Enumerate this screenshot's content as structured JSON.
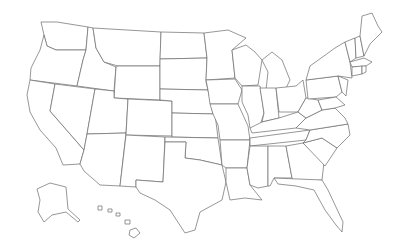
{
  "map": {
    "title": "",
    "type": "outline",
    "region": "United States",
    "background": "#ffffff",
    "stroke_color": "#6a6a6a",
    "states": [
      {
        "id": "WA",
        "points": "41,22 57,22 88,27 86,50 56,50 47,46 44,35"
      },
      {
        "id": "OR",
        "points": "44,35 47,46 56,50 86,50 83,60 77,86 30,80 31,68 40,50"
      },
      {
        "id": "CA",
        "points": "30,80 55,84 50,111 84,150 80,164 63,165 56,148 40,130 30,112 27,95"
      },
      {
        "id": "ID",
        "points": "88,27 93,28 96,48 104,62 116,67 114,91 77,86 83,60 86,50"
      },
      {
        "id": "NV",
        "points": "55,84 95,89 87,134 84,150 50,111"
      },
      {
        "id": "MT",
        "points": "93,28 161,32 160,66 118,66 104,62 96,48"
      },
      {
        "id": "WY",
        "points": "118,66 160,66 160,100 114,98 116,67"
      },
      {
        "id": "UT",
        "points": "95,89 114,91 114,98 128,99 126,133 87,134"
      },
      {
        "id": "AZ",
        "points": "87,134 126,133 120,186 100,185 84,171 80,164 84,150"
      },
      {
        "id": "CO",
        "points": "128,99 172,101 172,136 126,135"
      },
      {
        "id": "NM",
        "points": "126,135 165,137 163,182 136,180 136,187 120,186"
      },
      {
        "id": "ND",
        "points": "161,32 204,33 207,58 160,59"
      },
      {
        "id": "SD",
        "points": "160,59 207,58 206,82 208,90 160,89"
      },
      {
        "id": "NE",
        "points": "160,89 208,90 213,114 172,113 172,101 160,100"
      },
      {
        "id": "KS",
        "points": "172,113 215,114 218,138 172,137"
      },
      {
        "id": "OK",
        "points": "165,137 218,138 222,165 200,160 185,158 186,142 165,142"
      },
      {
        "id": "TX",
        "points": "165,142 186,142 185,158 200,160 222,165 226,182 222,200 200,212 195,230 185,233 170,210 155,200 140,193 136,187 136,180 163,182"
      },
      {
        "id": "MN",
        "points": "204,33 228,30 246,38 232,50 235,78 206,80 207,58"
      },
      {
        "id": "IA",
        "points": "206,80 235,79 242,90 238,104 210,104 208,90"
      },
      {
        "id": "MO",
        "points": "210,104 238,104 248,126 250,140 220,140 218,125 213,114"
      },
      {
        "id": "AR",
        "points": "220,140 250,140 247,168 226,168 222,165"
      },
      {
        "id": "LA",
        "points": "226,168 247,168 250,185 262,200 245,198 230,200 226,182"
      },
      {
        "id": "WI",
        "points": "232,50 246,45 255,52 262,60 258,85 242,86 235,78"
      },
      {
        "id": "IL",
        "points": "242,86 260,86 264,113 258,132 250,128 248,115 242,102"
      },
      {
        "id": "MI",
        "points": "262,60 272,52 282,60 290,80 285,90 266,90 268,72"
      },
      {
        "id": "IN",
        "points": "260,88 276,88 279,118 262,122 264,113"
      },
      {
        "id": "OH",
        "points": "276,88 296,86 303,80 306,98 298,112 279,112"
      },
      {
        "id": "KY",
        "points": "250,128 262,122 279,118 298,112 306,118 296,128 252,133"
      },
      {
        "id": "TN",
        "points": "250,138 310,130 306,140 250,146"
      },
      {
        "id": "MS",
        "points": "250,146 268,146 268,186 258,188 250,185 247,168"
      },
      {
        "id": "AL",
        "points": "268,146 286,146 292,178 274,178 270,186 268,186"
      },
      {
        "id": "GA",
        "points": "286,146 303,143 324,162 322,180 296,182 292,178"
      },
      {
        "id": "FL",
        "points": "274,178 322,180 328,190 343,222 342,232 336,225 325,210 314,190 296,186 278,184"
      },
      {
        "id": "SC",
        "points": "303,143 322,138 337,148 325,166"
      },
      {
        "id": "NC",
        "points": "306,140 310,130 348,124 350,135 337,148 322,138 303,143"
      },
      {
        "id": "VA",
        "points": "296,128 306,118 322,110 335,108 345,118 348,124 310,130"
      },
      {
        "id": "WV",
        "points": "298,112 306,98 318,100 322,110 306,118"
      },
      {
        "id": "PA",
        "points": "306,80 338,76 342,92 336,97 308,99"
      },
      {
        "id": "NY",
        "points": "310,66 335,48 345,42 350,62 352,78 338,76 306,80"
      },
      {
        "id": "MD",
        "points": "318,100 336,97 345,105 335,108 322,110"
      },
      {
        "id": "NJ",
        "points": "338,76 348,80 346,96 342,92"
      },
      {
        "id": "VT",
        "points": "345,42 355,38 356,58 350,62"
      },
      {
        "id": "NH",
        "points": "355,38 360,36 364,56 356,58"
      },
      {
        "id": "ME",
        "points": "360,36 362,16 372,13 378,26 382,32 370,44 364,56"
      },
      {
        "id": "MA",
        "points": "350,62 364,58 372,62 366,66 352,67"
      },
      {
        "id": "CT",
        "points": "352,67 362,66 362,74 352,76"
      },
      {
        "id": "RI",
        "points": "362,66 366,66 366,72 362,74"
      },
      {
        "id": "AK",
        "points": "37,189 50,183 66,187 68,209 80,220 78,222 66,212 52,215 44,222 38,212 40,200"
      },
      {
        "id": "HI-1",
        "points": "98,206 102,206 102,210 98,210"
      },
      {
        "id": "HI-2",
        "points": "108,209 112,209 112,212 108,212"
      },
      {
        "id": "HI-3",
        "points": "116,213 120,213 120,216 116,216"
      },
      {
        "id": "HI-4",
        "points": "125,220 130,220 130,224 125,224"
      },
      {
        "id": "HI-5",
        "points": "130,230 136,228 140,233 134,238 129,235"
      }
    ]
  }
}
